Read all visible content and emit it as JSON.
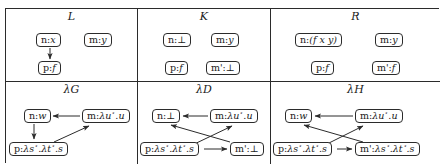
{
  "figure": {
    "kind": "double-pushout-graph-rewriting-diagram",
    "ink_color": "#2b2b2b",
    "background": "#ffffff"
  },
  "panels": [
    {
      "id": "L",
      "title": "L",
      "nodes": [
        {
          "id": "L-nx",
          "name": "n",
          "value": "x",
          "label": "n:x"
        },
        {
          "id": "L-my",
          "name": "m",
          "value": "y",
          "label": "m:y"
        },
        {
          "id": "L-pf",
          "name": "p",
          "value": "f",
          "label": "p:f"
        }
      ],
      "edges": [
        {
          "from": "L-nx",
          "to": "L-pf",
          "style": "arrow"
        }
      ]
    },
    {
      "id": "K",
      "title": "K",
      "nodes": [
        {
          "id": "K-nb",
          "name": "n",
          "value": "⊥",
          "label": "n:⊥"
        },
        {
          "id": "K-my",
          "name": "m",
          "value": "y",
          "label": "m:y"
        },
        {
          "id": "K-pf",
          "name": "p",
          "value": "f",
          "label": "p:f"
        },
        {
          "id": "K-mb",
          "name": "m'",
          "value": "⊥",
          "label": "m':⊥"
        }
      ],
      "edges": []
    },
    {
      "id": "R",
      "title": "R",
      "nodes": [
        {
          "id": "R-nfxy",
          "name": "n",
          "value": "(f x y)",
          "label": "n:(f x y)"
        },
        {
          "id": "R-my",
          "name": "m",
          "value": "y",
          "label": "m:y"
        },
        {
          "id": "R-pf",
          "name": "p",
          "value": "f",
          "label": "p:f"
        },
        {
          "id": "R-mf",
          "name": "m'",
          "value": "f",
          "label": "m':f"
        }
      ],
      "edges": []
    },
    {
      "id": "lambdaG",
      "title": "λG",
      "nodes": [
        {
          "id": "G-nw",
          "name": "n",
          "value": "w",
          "label": "n:w"
        },
        {
          "id": "G-mu",
          "name": "m",
          "value": "λu⋆.u",
          "label": "m:λu⋆.u"
        },
        {
          "id": "G-ps",
          "name": "p",
          "value": "λs⋆.λt⋆.s",
          "label": "p:λs⋆.λt⋆.s"
        }
      ],
      "edges": [
        {
          "from": "G-mu",
          "to": "G-nw",
          "style": "arrow"
        },
        {
          "from": "G-nw",
          "to": "G-ps",
          "style": "arrow"
        },
        {
          "from": "G-ps",
          "to": "G-mu",
          "style": "arrow"
        }
      ]
    },
    {
      "id": "lambdaD",
      "title": "λD",
      "nodes": [
        {
          "id": "D-nb",
          "name": "n",
          "value": "⊥",
          "label": "n:⊥"
        },
        {
          "id": "D-mu",
          "name": "m",
          "value": "λu⋆.u",
          "label": "m:λu⋆.u"
        },
        {
          "id": "D-ps",
          "name": "p",
          "value": "λs⋆.λt⋆.s",
          "label": "p:λs⋆.λt⋆.s"
        },
        {
          "id": "D-mb",
          "name": "m'",
          "value": "⊥",
          "label": "m':⊥"
        }
      ],
      "edges": [
        {
          "from": "D-mu",
          "to": "D-nb",
          "style": "arrow"
        },
        {
          "from": "D-mb",
          "to": "D-nb",
          "style": "arrow"
        },
        {
          "from": "D-ps",
          "to": "D-mu",
          "style": "arrow"
        },
        {
          "from": "D-ps",
          "to": "D-mb",
          "style": "arrow"
        }
      ]
    },
    {
      "id": "lambdaH",
      "title": "λH",
      "nodes": [
        {
          "id": "H-nw",
          "name": "n",
          "value": "w",
          "label": "n:w"
        },
        {
          "id": "H-mu",
          "name": "m",
          "value": "λu⋆.u",
          "label": "m:λu⋆.u"
        },
        {
          "id": "H-ps",
          "name": "p",
          "value": "λs⋆.λt⋆.s",
          "label": "p:λs⋆.λt⋆.s"
        },
        {
          "id": "H-mps",
          "name": "m'",
          "value": "λs⋆.λt⋆.s",
          "label": "m':λs⋆.λt⋆.s"
        }
      ],
      "edges": [
        {
          "from": "H-mu",
          "to": "H-nw",
          "style": "arrow"
        },
        {
          "from": "H-mps",
          "to": "H-nw",
          "style": "arrow"
        },
        {
          "from": "H-ps",
          "to": "H-mu",
          "style": "arrow"
        },
        {
          "from": "H-ps",
          "to": "H-mps",
          "style": "arrow"
        }
      ]
    }
  ]
}
